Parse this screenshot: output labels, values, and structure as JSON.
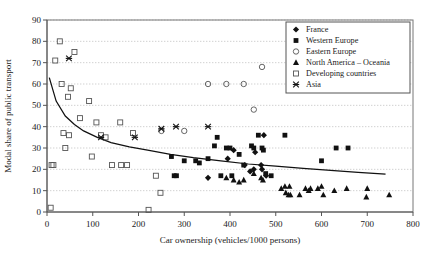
{
  "chart_data": {
    "type": "scatter",
    "title": "",
    "xlabel": "Car ownership (vehicles/1000 persons)",
    "ylabel": "Modal share of public transport",
    "xlim": [
      0,
      800
    ],
    "ylim": [
      0,
      90
    ],
    "xticks": [
      0,
      100,
      200,
      300,
      400,
      500,
      600,
      700,
      800
    ],
    "yticks": [
      0,
      10,
      20,
      30,
      40,
      50,
      60,
      70,
      80,
      90
    ],
    "grid": "horizontal-dotted",
    "legend_position": "top-right",
    "series": [
      {
        "name": "France",
        "marker": "filled-diamond",
        "color": "#111111",
        "points": [
          [
            352,
            16
          ],
          [
            395,
            25
          ],
          [
            408,
            29
          ],
          [
            432,
            22
          ],
          [
            444,
            19
          ],
          [
            452,
            20
          ],
          [
            455,
            28
          ],
          [
            468,
            22
          ],
          [
            470,
            20
          ],
          [
            474,
            36
          ],
          [
            479,
            17
          ]
        ]
      },
      {
        "name": "Western Europe",
        "marker": "filled-square",
        "color": "#111111",
        "points": [
          [
            272,
            26
          ],
          [
            278,
            17
          ],
          [
            283,
            17
          ],
          [
            300,
            24
          ],
          [
            325,
            24
          ],
          [
            333,
            23
          ],
          [
            352,
            25
          ],
          [
            366,
            31
          ],
          [
            372,
            35
          ],
          [
            380,
            17
          ],
          [
            392,
            30
          ],
          [
            400,
            30
          ],
          [
            404,
            17
          ],
          [
            420,
            27
          ],
          [
            430,
            22
          ],
          [
            447,
            31
          ],
          [
            452,
            30
          ],
          [
            462,
            36
          ],
          [
            470,
            30
          ],
          [
            473,
            29
          ],
          [
            478,
            18
          ],
          [
            490,
            17
          ],
          [
            520,
            36
          ],
          [
            600,
            24
          ],
          [
            632,
            30
          ],
          [
            658,
            30
          ]
        ]
      },
      {
        "name": "Eastern Europe",
        "marker": "open-circle",
        "points": [
          [
            250,
            38
          ],
          [
            300,
            38
          ],
          [
            352,
            60
          ],
          [
            392,
            60
          ],
          [
            430,
            60
          ],
          [
            452,
            48
          ],
          [
            470,
            68
          ]
        ]
      },
      {
        "name": "North America – Oceania",
        "marker": "filled-triangle",
        "points": [
          [
            392,
            16
          ],
          [
            408,
            15
          ],
          [
            420,
            14
          ],
          [
            430,
            15
          ],
          [
            452,
            18
          ],
          [
            468,
            16
          ],
          [
            472,
            15
          ],
          [
            512,
            11
          ],
          [
            520,
            12
          ],
          [
            522,
            9
          ],
          [
            528,
            8
          ],
          [
            530,
            12
          ],
          [
            532,
            8
          ],
          [
            552,
            8
          ],
          [
            565,
            11
          ],
          [
            572,
            10
          ],
          [
            576,
            11
          ],
          [
            592,
            11
          ],
          [
            600,
            12
          ],
          [
            604,
            8
          ],
          [
            628,
            10
          ],
          [
            655,
            11
          ],
          [
            698,
            7
          ],
          [
            700,
            11
          ],
          [
            748,
            8
          ]
        ]
      },
      {
        "name": "Developing countries",
        "marker": "open-square",
        "points": [
          [
            8,
            2
          ],
          [
            10,
            22
          ],
          [
            14,
            22
          ],
          [
            18,
            71
          ],
          [
            28,
            80
          ],
          [
            32,
            60
          ],
          [
            36,
            37
          ],
          [
            40,
            30
          ],
          [
            46,
            54
          ],
          [
            48,
            36
          ],
          [
            52,
            58
          ],
          [
            60,
            75
          ],
          [
            72,
            44
          ],
          [
            92,
            52
          ],
          [
            98,
            26
          ],
          [
            108,
            42
          ],
          [
            118,
            36
          ],
          [
            128,
            35
          ],
          [
            142,
            22
          ],
          [
            160,
            42
          ],
          [
            162,
            22
          ],
          [
            175,
            22
          ],
          [
            188,
            37
          ],
          [
            222,
            1
          ],
          [
            238,
            17
          ],
          [
            248,
            9
          ]
        ]
      },
      {
        "name": "Asia",
        "marker": "x-star",
        "points": [
          [
            48,
            72
          ],
          [
            118,
            35
          ],
          [
            192,
            35
          ],
          [
            250,
            39
          ],
          [
            282,
            40
          ],
          [
            352,
            40
          ]
        ]
      }
    ],
    "trend_curve": {
      "description": "fitted power/log decay curve",
      "points": [
        [
          5,
          63
        ],
        [
          20,
          52
        ],
        [
          40,
          45
        ],
        [
          60,
          41
        ],
        [
          80,
          38
        ],
        [
          110,
          35
        ],
        [
          140,
          32.5
        ],
        [
          180,
          30.5
        ],
        [
          220,
          29
        ],
        [
          270,
          27
        ],
        [
          320,
          25.5
        ],
        [
          380,
          24
        ],
        [
          440,
          22.5
        ],
        [
          500,
          21.5
        ],
        [
          560,
          20.5
        ],
        [
          620,
          19.5
        ],
        [
          680,
          18.6
        ],
        [
          740,
          17.8
        ]
      ]
    }
  },
  "legend": {
    "items": [
      {
        "label": "France"
      },
      {
        "label": "Western Europe"
      },
      {
        "label": "Eastern Europe"
      },
      {
        "label": "North America – Oceania"
      },
      {
        "label": "Developing countries"
      },
      {
        "label": "Asia"
      }
    ]
  }
}
